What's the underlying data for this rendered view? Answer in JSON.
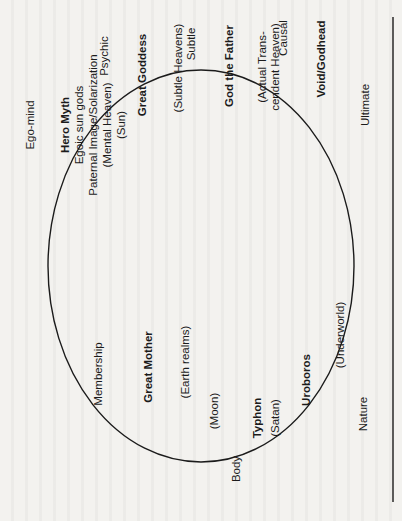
{
  "diagram": {
    "orientation": "rotated -90 degrees",
    "outer_labels": {
      "psychic": "Psychic",
      "subtle": "Subtle",
      "causal": "Causal",
      "ultimate": "Ultimate",
      "ego_mind": "Ego-mind",
      "membership": "Membership",
      "body": "Body",
      "nature": "Nature"
    },
    "inner_labels": {
      "hero_myth": "Hero Myth",
      "egoic_sun_gods": "Egoic sun gods",
      "paternal_image": "Paternal Image/Solarization",
      "mental_heaven": "(Mental Heaven)",
      "sun": "(Sun)",
      "great_goddess": "Great Goddess",
      "subtle_heavens": "(Subtle Heavens)",
      "god_the_father": "God the Father",
      "actual_transcendent_heaven": "(Actual Trans-\ncendent Heaven)",
      "void_godhead": "Void/Godhead",
      "great_mother": "Great Mother",
      "earth_realms": "(Earth realms)",
      "moon": "(Moon)",
      "typhon": "Typhon",
      "satan": "(Satan)",
      "uroboros": "Uroboros",
      "underworld": "(Underworld)"
    },
    "colors": {
      "ink": "#1b1b1b",
      "paper": "#f3f2ef"
    }
  }
}
